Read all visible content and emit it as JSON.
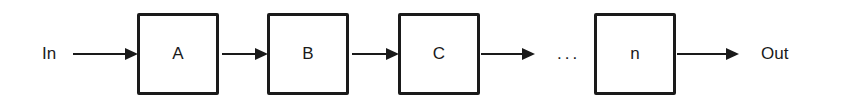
{
  "diagram": {
    "input_label": "In",
    "output_label": "Out",
    "ellipsis": "...",
    "blocks": [
      {
        "label": "A"
      },
      {
        "label": "B"
      },
      {
        "label": "C"
      },
      {
        "label": "n"
      }
    ],
    "stroke_color": "#1a1a1a",
    "background_color": "#ffffff"
  }
}
